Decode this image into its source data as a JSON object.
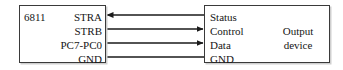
{
  "diagram": {
    "title_hidden": "",
    "background_color": "#ffffff",
    "line_color": "#1a1a1a",
    "border_color": "#3a3a3a",
    "text_color": "#161616"
  },
  "mcu": {
    "name": "6811",
    "pins": [
      {
        "label": "STRA"
      },
      {
        "label": "STRB"
      },
      {
        "label": "PC7-PC0"
      },
      {
        "label": "GND"
      }
    ]
  },
  "device": {
    "name_line1": "Output",
    "name_line2": "device",
    "signals": [
      {
        "label": "Status"
      },
      {
        "label": "Control"
      },
      {
        "label": "Data"
      },
      {
        "label": "GND"
      }
    ]
  },
  "connections": [
    {
      "from": "STRA",
      "to": "Status",
      "direction": "left",
      "arrow": true
    },
    {
      "from": "STRB",
      "to": "Control",
      "direction": "right",
      "arrow": true
    },
    {
      "from": "PC7-PC0",
      "to": "Data",
      "direction": "right",
      "arrow": true
    },
    {
      "from": "GND",
      "to": "GND",
      "direction": "none",
      "arrow": false
    }
  ]
}
